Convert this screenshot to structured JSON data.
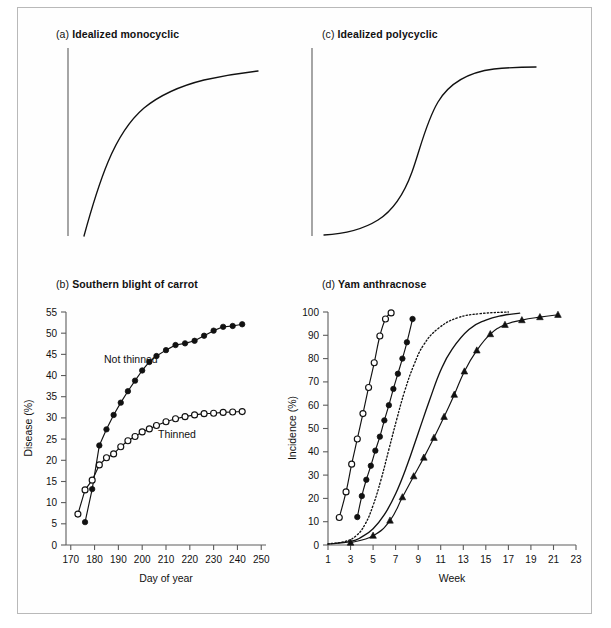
{
  "figure": {
    "background": "#ffffff",
    "frame_color": "#b9b9b9",
    "ink_color": "#111111"
  },
  "panels": {
    "a": {
      "tag": "(a)",
      "title": "Idealized monocyclic"
    },
    "b": {
      "tag": "(b)",
      "title": "Southern blight of carrot"
    },
    "c": {
      "tag": "(c)",
      "title": "Idealized polycyclic"
    },
    "d": {
      "tag": "(d)",
      "title": "Yam anthracnose"
    }
  },
  "chart_data": [
    {
      "id": "a",
      "type": "line",
      "title": "(a) Idealized monocyclic",
      "xlabel": "",
      "ylabel": "",
      "xlim": [
        0,
        1
      ],
      "ylim": [
        0,
        1
      ],
      "grid": false,
      "axes_shown": [
        "left"
      ],
      "ticks": {
        "x": [],
        "y": []
      },
      "series": [
        {
          "name": "monocyclic (monomolecular) curve",
          "style": "solid",
          "marker": "none",
          "x": [
            0.06,
            0.1,
            0.14,
            0.18,
            0.22,
            0.26,
            0.31,
            0.36,
            0.42,
            0.5,
            0.58,
            0.68,
            0.78,
            0.88,
            0.97
          ],
          "y": [
            0.02,
            0.12,
            0.22,
            0.32,
            0.42,
            0.51,
            0.6,
            0.67,
            0.73,
            0.79,
            0.84,
            0.88,
            0.91,
            0.93,
            0.95
          ]
        }
      ]
    },
    {
      "id": "b",
      "type": "line",
      "title": "(b) Southern blight of carrot",
      "xlabel": "Day of year",
      "ylabel": "Disease (%)",
      "xlim": [
        168,
        252
      ],
      "ylim": [
        0,
        55
      ],
      "xticks": [
        170,
        180,
        190,
        200,
        210,
        220,
        230,
        240,
        250
      ],
      "yticks": [
        0,
        5,
        10,
        15,
        20,
        25,
        30,
        35,
        40,
        45,
        50,
        55
      ],
      "grid": false,
      "legend_position": "inline-annotation",
      "series": [
        {
          "name": "Not thinned",
          "marker": "filled-circle",
          "style": "solid",
          "x": [
            176,
            179,
            182,
            185,
            188,
            191,
            194,
            197,
            200,
            203,
            206,
            210,
            214,
            218,
            222,
            226,
            230,
            234,
            238,
            242
          ],
          "y": [
            5.4,
            13.2,
            23.5,
            27.3,
            30.7,
            33.6,
            36.3,
            38.8,
            41.2,
            43.2,
            44.6,
            46.0,
            47.2,
            47.6,
            48.2,
            49.4,
            50.6,
            51.5,
            51.7,
            52.1
          ]
        },
        {
          "name": "Thinned",
          "marker": "open-circle",
          "style": "solid",
          "x": [
            173,
            176,
            179,
            182,
            185,
            188,
            191,
            194,
            197,
            200,
            203,
            206,
            210,
            214,
            218,
            222,
            226,
            230,
            234,
            238,
            242
          ],
          "y": [
            7.3,
            13.0,
            15.3,
            18.9,
            20.6,
            21.5,
            23.2,
            24.6,
            25.6,
            26.7,
            27.4,
            28.2,
            29.1,
            29.8,
            30.3,
            30.7,
            31.0,
            31.1,
            31.3,
            31.4,
            31.5
          ]
        }
      ]
    },
    {
      "id": "c",
      "type": "line",
      "title": "(c) Idealized polycyclic",
      "xlabel": "",
      "ylabel": "",
      "xlim": [
        0,
        1
      ],
      "ylim": [
        0,
        1
      ],
      "grid": false,
      "axes_shown": [
        "left"
      ],
      "ticks": {
        "x": [],
        "y": []
      },
      "series": [
        {
          "name": "polycyclic (logistic) curve",
          "style": "solid",
          "marker": "none",
          "x": [
            0.06,
            0.14,
            0.22,
            0.3,
            0.37,
            0.43,
            0.48,
            0.52,
            0.56,
            0.6,
            0.65,
            0.72,
            0.8,
            0.88,
            0.97
          ],
          "y": [
            0.03,
            0.05,
            0.08,
            0.14,
            0.23,
            0.35,
            0.48,
            0.6,
            0.71,
            0.8,
            0.87,
            0.92,
            0.95,
            0.96,
            0.965
          ]
        }
      ]
    },
    {
      "id": "d",
      "type": "line",
      "title": "(d) Yam anthracnose",
      "xlabel": "Week",
      "ylabel": "Incidence (%)",
      "xlim": [
        1,
        23
      ],
      "ylim": [
        0,
        100
      ],
      "xticks": [
        1,
        3,
        5,
        7,
        9,
        11,
        13,
        15,
        17,
        19,
        21,
        23
      ],
      "yticks": [
        0,
        10,
        20,
        30,
        40,
        50,
        60,
        70,
        80,
        90,
        100
      ],
      "grid": false,
      "series": [
        {
          "name": "open-circle series",
          "marker": "open-circle",
          "style": "solid",
          "x": [
            2.0,
            2.6,
            3.1,
            3.6,
            4.1,
            4.6,
            5.1,
            5.6,
            6.1,
            6.6
          ],
          "y": [
            11.8,
            22.8,
            34.7,
            45.5,
            56.4,
            67.6,
            78.2,
            89.7,
            97.0,
            99.6
          ]
        },
        {
          "name": "filled-circle series",
          "marker": "filled-circle",
          "style": "solid",
          "x": [
            3.6,
            4.0,
            4.4,
            4.8,
            5.2,
            5.6,
            6.0,
            6.4,
            6.8,
            7.2,
            7.6,
            8.0,
            8.5
          ],
          "y": [
            12.0,
            21.0,
            28.0,
            34.0,
            40.5,
            46.5,
            53.5,
            60.0,
            67.0,
            73.5,
            80.0,
            87.0,
            97.0
          ]
        },
        {
          "name": "dotted series",
          "marker": "none",
          "style": "dotted",
          "x": [
            1.0,
            2.5,
            3.5,
            4.3,
            5.0,
            5.7,
            6.4,
            7.1,
            7.8,
            8.6,
            9.5,
            10.8,
            12.5,
            14.5,
            17.0
          ],
          "y": [
            0.5,
            1.5,
            4.0,
            9.0,
            17.0,
            28.0,
            41.0,
            54.0,
            66.0,
            77.0,
            86.0,
            93.0,
            97.5,
            99.3,
            100.0
          ]
        },
        {
          "name": "solid-no-marker series",
          "marker": "none",
          "style": "solid",
          "x": [
            1.0,
            3.0,
            4.0,
            5.0,
            6.0,
            7.0,
            8.0,
            9.0,
            10.0,
            11.0,
            12.0,
            13.5,
            15.0,
            16.5,
            18.0
          ],
          "y": [
            0.4,
            1.5,
            3.5,
            7.0,
            13.0,
            22.0,
            34.0,
            48.0,
            62.0,
            75.0,
            84.0,
            92.5,
            96.5,
            98.5,
            99.5
          ]
        },
        {
          "name": "filled-triangle series",
          "marker": "filled-triangle",
          "style": "solid",
          "x": [
            3.0,
            5.0,
            6.5,
            7.6,
            8.6,
            9.5,
            10.4,
            11.3,
            12.2,
            13.1,
            14.2,
            15.4,
            16.7,
            18.2,
            19.8,
            21.4
          ],
          "y": [
            1.0,
            4.0,
            10.5,
            20.5,
            29.5,
            37.5,
            46.0,
            55.0,
            64.5,
            74.5,
            83.5,
            90.5,
            94.5,
            96.5,
            97.8,
            98.8
          ]
        }
      ],
      "annotations": []
    }
  ],
  "labels": {
    "b_series_not_thinned": "Not thinned",
    "b_series_thinned": "Thinned",
    "b_xlabel": "Day of year",
    "b_ylabel": "Disease (%)",
    "d_xlabel": "Week",
    "d_ylabel": "Incidence (%)",
    "b_xticks": [
      "170",
      "180",
      "190",
      "200",
      "210",
      "220",
      "230",
      "240",
      "250"
    ],
    "b_yticks": [
      "0",
      "5",
      "10",
      "15",
      "20",
      "25",
      "30",
      "35",
      "40",
      "45",
      "50",
      "55"
    ],
    "d_xticks": [
      "1",
      "3",
      "5",
      "7",
      "9",
      "11",
      "13",
      "15",
      "17",
      "19",
      "21",
      "23"
    ],
    "d_yticks": [
      "0",
      "10",
      "20",
      "30",
      "40",
      "50",
      "60",
      "70",
      "80",
      "90",
      "100"
    ]
  }
}
